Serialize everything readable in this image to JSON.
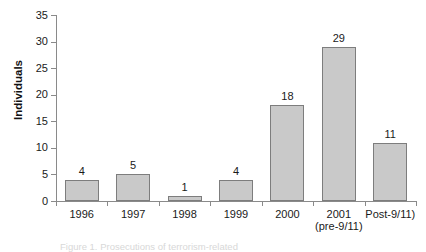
{
  "chart_data": {
    "type": "bar",
    "title": "",
    "subtitle": "",
    "xlabel": "",
    "ylabel": "Individuals",
    "categories": [
      "1996",
      "1997",
      "1998",
      "1999",
      "2000",
      "2001",
      "Post-9/11)"
    ],
    "category_sublabels": [
      "",
      "",
      "",
      "",
      "",
      "(pre-9/11)",
      ""
    ],
    "values": [
      4,
      5,
      1,
      4,
      18,
      29,
      11
    ],
    "data_labels": [
      "4",
      "5",
      "1",
      "4",
      "18",
      "29",
      "11"
    ],
    "ylim": [
      0,
      35
    ],
    "ytick_values": [
      0,
      5,
      10,
      15,
      20,
      25,
      30,
      35
    ],
    "ytick_labels": [
      "0",
      "5",
      "10",
      "15",
      "20",
      "25",
      "30",
      "35"
    ],
    "grid": false,
    "legend": false,
    "legend_position": "none",
    "bar_fill_color": "#c9c9c9",
    "bar_border_color": "#7d7d7d",
    "axis_color": "#8a8a8a",
    "text_color": "#1a1a1a"
  },
  "caption": {
    "text": "Figure 1. Prosecutions of terrorism-related"
  }
}
